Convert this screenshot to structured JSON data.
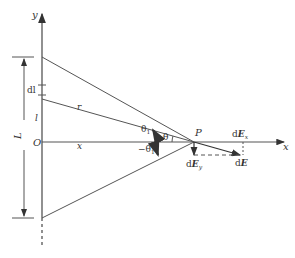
{
  "diagram": {
    "labels": {
      "y_axis": "y",
      "x_axis": "x",
      "origin": "O",
      "length": "L",
      "element": "dl",
      "position": "l",
      "distance_r": "r",
      "distance_x": "x",
      "point": "P",
      "theta1": "θ",
      "theta1_sub": "1",
      "theta": "θ",
      "neg_theta1": "−θ",
      "neg_theta1_sub": "1",
      "dEx": "dE",
      "dEx_sub": "x",
      "dEy": "dE",
      "dEy_sub": "y",
      "dE": "dE"
    },
    "colors": {
      "line": "#555555",
      "text": "#333333"
    }
  }
}
